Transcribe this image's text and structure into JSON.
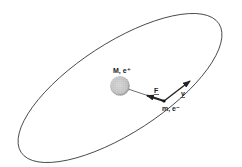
{
  "diagram": {
    "title": "",
    "nucleus": {
      "label": "M, e⁺"
    },
    "electron": {
      "label": "m, e⁻"
    },
    "force_vector": {
      "label": "F"
    },
    "velocity_vector": {
      "label": "v"
    },
    "colors": {
      "stroke": "#222222",
      "nucleus_fill": "#bdbdbd",
      "background": "#ffffff"
    }
  }
}
